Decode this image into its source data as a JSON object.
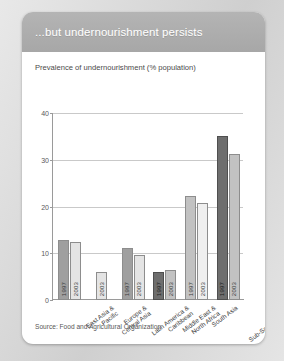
{
  "card": {
    "header_title": "...but undernourishment persists",
    "source": "Source: Food and Agricultural Organization"
  },
  "chart_data": {
    "type": "bar",
    "title": "Prevalence of undernourishment (% population)",
    "subtitle": "",
    "xlabel": "",
    "ylabel": "",
    "ylim": [
      0,
      40
    ],
    "yticks": [
      "0",
      "10",
      "20",
      "30",
      "40"
    ],
    "grid": true,
    "legend": "none",
    "categories": [
      "East Asia & Pacific",
      "Europe & Central Asia",
      "Latin America & Caribbean",
      "Middle East & North Africa",
      "South Asia",
      "Sub-Saharan Africa"
    ],
    "series": [
      {
        "name": "1997",
        "values": [
          12.8,
          null,
          11.2,
          6.0,
          22.2,
          35.0
        ]
      },
      {
        "name": "2003",
        "values": [
          12.4,
          6.0,
          9.6,
          6.4,
          20.8,
          31.2
        ]
      }
    ],
    "bars": [
      {
        "category": "East Asia & Pacific",
        "year": "1997",
        "value": 12.8,
        "color": "#9f9f9f"
      },
      {
        "category": "East Asia & Pacific",
        "year": "2003",
        "value": 12.4,
        "color": "#e4e4e4"
      },
      {
        "category": "Europe & Central Asia",
        "year": "2003",
        "value": 6.0,
        "color": "#e4e4e4"
      },
      {
        "category": "Latin America & Caribbean",
        "year": "1997",
        "value": 11.2,
        "color": "#9f9f9f"
      },
      {
        "category": "Latin America & Caribbean",
        "year": "2003",
        "value": 9.6,
        "color": "#e4e4e4"
      },
      {
        "category": "Middle East & North Africa",
        "year": "1997",
        "value": 6.0,
        "color": "#6e6e6e"
      },
      {
        "category": "Middle East & North Africa",
        "year": "2003",
        "value": 6.4,
        "color": "#c2c2c2"
      },
      {
        "category": "South Asia",
        "year": "1997",
        "value": 22.2,
        "color": "#c2c2c2"
      },
      {
        "category": "South Asia",
        "year": "2003",
        "value": 20.8,
        "color": "#efefef"
      },
      {
        "category": "Sub-Saharan Africa",
        "year": "1997",
        "value": 35.0,
        "color": "#6e6e6e"
      },
      {
        "category": "Sub-Saharan Africa",
        "year": "2003",
        "value": 31.2,
        "color": "#c2c2c2"
      }
    ],
    "category_labels": [
      {
        "line1": "East Asia &",
        "line2": "Pacific"
      },
      {
        "line1": "Europe &",
        "line2": "Central Asia"
      },
      {
        "line1": "Latin America &",
        "line2": "Caribbean"
      },
      {
        "line1": "Middle East &",
        "line2": "North Africa"
      },
      {
        "line1": "South Asia",
        "line2": ""
      },
      {
        "line1": "Sub-Saharan Africa",
        "line2": ""
      }
    ]
  }
}
